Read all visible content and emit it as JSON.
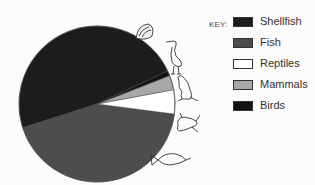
{
  "chart_data": {
    "type": "pie",
    "title": "",
    "categories": [
      "Shellfish",
      "Fish",
      "Reptiles",
      "Mammals",
      "Birds"
    ],
    "values": [
      48,
      43,
      5,
      3,
      1
    ],
    "unit": "percent (estimated from slice angles)",
    "colors": [
      "#1c1c1c",
      "#4d4d4d",
      "#ffffff",
      "#a8a8a8",
      "#121212"
    ],
    "legend": {
      "position": "right",
      "title": "KEY:"
    },
    "icons": [
      "shell-icon",
      "egret-bird-icon",
      "kangaroo-icon",
      "lizard-icon",
      "fish-icon"
    ]
  },
  "legend": {
    "title": "KEY:",
    "items": [
      {
        "label": "Shellfish",
        "color": "#1c1c1c"
      },
      {
        "label": "Fish",
        "color": "#4d4d4d"
      },
      {
        "label": "Reptiles",
        "color": "#ffffff"
      },
      {
        "label": "Mammals",
        "color": "#a8a8a8"
      },
      {
        "label": "Birds",
        "color": "#121212"
      }
    ]
  }
}
